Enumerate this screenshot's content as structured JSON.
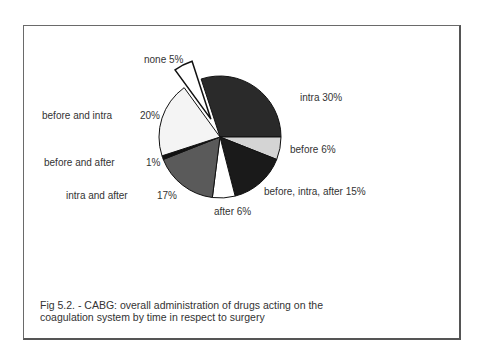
{
  "chart_data": {
    "type": "pie",
    "title": "Fig 5.2. - CABG: overall administration of drugs acting on the coagulation system by time in respect to surgery",
    "categories": [
      "intra",
      "before",
      "before, intra, after",
      "after",
      "intra and after",
      "before and after",
      "before and intra",
      "none"
    ],
    "values": [
      30,
      6,
      15,
      6,
      17,
      1,
      20,
      5
    ],
    "unit": "%",
    "exploded": [
      "none"
    ],
    "colors": [
      "#2a2a2a",
      "#d4d4d4",
      "#1a1a1a",
      "#ffffff",
      "#5a5a5a",
      "#111111",
      "#f4f4f4",
      "#ffffff"
    ],
    "legend": "none (labels placed next to slices)"
  },
  "labels": {
    "intra": "intra 30%",
    "before": "before  6%",
    "bia": "before, intra, after 15%",
    "after": "after 6%",
    "ia_name": "intra and after",
    "ia_pct": "17%",
    "ba_name": "before and after",
    "ba_pct": "1%",
    "bi_name": "before and intra",
    "bi_pct": "20%",
    "none": "none 5%"
  },
  "caption": {
    "line1": "Fig 5.2. - CABG: overall administration of drugs acting on the",
    "line2": "coagulation system by  time in respect  to surgery"
  }
}
